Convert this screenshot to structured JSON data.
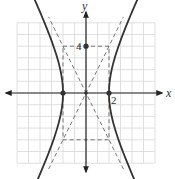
{
  "chart_data": {
    "type": "line",
    "title": "",
    "xlabel": "x",
    "ylabel": "y",
    "xlim": [
      -6,
      6
    ],
    "ylim": [
      -6,
      6
    ],
    "grid": true,
    "equation": "x^2/4 - y^2/16 = 1",
    "hyperbola": {
      "a": 2,
      "b": 4,
      "center": [
        0,
        0
      ],
      "orientation": "horizontal"
    },
    "vertices": [
      [
        -2,
        0
      ],
      [
        2,
        0
      ]
    ],
    "co_vertices": [
      [
        0,
        4
      ],
      [
        0,
        -4
      ]
    ],
    "center": [
      0,
      0
    ],
    "asymptotes": [
      {
        "slope": 2,
        "intercept": 0,
        "style": "dashed"
      },
      {
        "slope": -2,
        "intercept": 0,
        "style": "dashed"
      }
    ],
    "fundamental_rectangle": {
      "x": [
        -2,
        2
      ],
      "y": [
        -4,
        4
      ],
      "style": "dashed"
    },
    "tick_labels": [
      {
        "axis": "x",
        "value": 2,
        "text": "2"
      },
      {
        "axis": "y",
        "value": 4,
        "text": "4"
      }
    ],
    "colors": {
      "curve": "#333333",
      "grid": "#d8d8d8",
      "axis": "#222222",
      "dashed": "#666666"
    }
  }
}
